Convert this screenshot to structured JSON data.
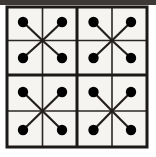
{
  "figure": {
    "title": "4x4 grid with four X-shaped dot clusters",
    "canvas": {
      "width": 156,
      "height": 157
    },
    "colors": {
      "page_background": "#ffffff",
      "cell_fill": "#f5f4f1",
      "grid_line": "#2a2724",
      "outer_border": "#1c1a18",
      "dot_fill": "#000000",
      "spoke_line": "#231f1d",
      "top_band": "#3c3836"
    },
    "geometry": {
      "outer_border_width": 3,
      "major_line_width": 3,
      "minor_line_width": 1.6,
      "spoke_line_width": 2.2,
      "dot_radius": 5.2,
      "grid_left": 7,
      "grid_top": 7,
      "grid_right": 147,
      "grid_bottom": 147,
      "x_gridlines": [
        7,
        42.5,
        77,
        112,
        147
      ],
      "y_gridlines": [
        7,
        40.5,
        75,
        111,
        147
      ],
      "top_band_height": 5
    },
    "quadrants": [
      {
        "name": "top-left",
        "center": {
          "x": 42.5,
          "y": 40.5
        },
        "dots": [
          {
            "name": "top-left-dot",
            "x": 23,
            "y": 22
          },
          {
            "name": "top-right-dot",
            "x": 62,
            "y": 22
          },
          {
            "name": "bottom-left-dot",
            "x": 23,
            "y": 58
          },
          {
            "name": "bottom-right-dot",
            "x": 62,
            "y": 58
          }
        ]
      },
      {
        "name": "top-right",
        "center": {
          "x": 112,
          "y": 40.5
        },
        "dots": [
          {
            "name": "top-left-dot",
            "x": 93.5,
            "y": 22
          },
          {
            "name": "top-right-dot",
            "x": 131,
            "y": 22
          },
          {
            "name": "bottom-left-dot",
            "x": 93.5,
            "y": 58
          },
          {
            "name": "bottom-right-dot",
            "x": 131,
            "y": 58
          }
        ]
      },
      {
        "name": "bottom-left",
        "center": {
          "x": 42.5,
          "y": 111
        },
        "dots": [
          {
            "name": "top-left-dot",
            "x": 23,
            "y": 92
          },
          {
            "name": "top-right-dot",
            "x": 62,
            "y": 92
          },
          {
            "name": "bottom-left-dot",
            "x": 23,
            "y": 130
          },
          {
            "name": "bottom-right-dot",
            "x": 62,
            "y": 130
          }
        ]
      },
      {
        "name": "bottom-right",
        "center": {
          "x": 112,
          "y": 111
        },
        "dots": [
          {
            "name": "top-left-dot",
            "x": 93.5,
            "y": 92
          },
          {
            "name": "top-right-dot",
            "x": 131,
            "y": 92
          },
          {
            "name": "bottom-left-dot",
            "x": 93.5,
            "y": 130
          },
          {
            "name": "bottom-right-dot",
            "x": 131,
            "y": 130
          }
        ]
      }
    ],
    "counts": {
      "rows": 4,
      "columns": 4,
      "cells": 16,
      "quadrants": 4,
      "dots_per_quadrant": 4,
      "dots_total": 16,
      "spokes_total": 16
    }
  }
}
